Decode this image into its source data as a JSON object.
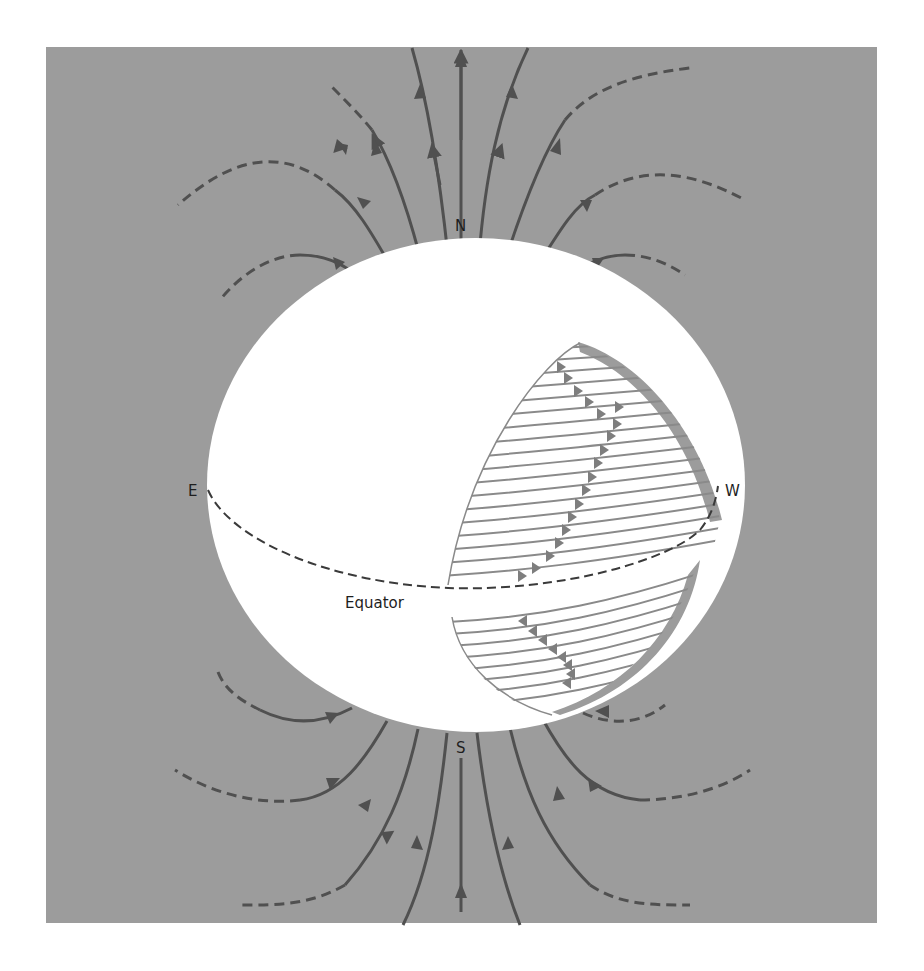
{
  "figure": {
    "background_color": "#9c9c9c",
    "sphere_color": "#ffffff",
    "line_color": "#505050",
    "cutaway_line_color": "#8a8a8a",
    "labels": {
      "north": "N",
      "south": "S",
      "east": "E",
      "west": "W",
      "equator": "Equator"
    }
  }
}
